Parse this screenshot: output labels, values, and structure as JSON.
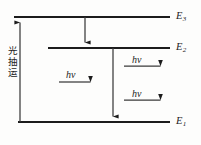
{
  "figure": {
    "type": "energy-level-diagram",
    "background_color": "#fdfdfc",
    "ink_color": "#1c1c1c",
    "width": 201,
    "height": 145
  },
  "levels": [
    {
      "id": "E3",
      "label": "E",
      "subscript": "3",
      "y": 17,
      "x_start": 14,
      "x_end": 170,
      "label_x": 176,
      "label_y": 11
    },
    {
      "id": "E2",
      "label": "E",
      "subscript": "2",
      "y": 48,
      "x_start": 48,
      "x_end": 170,
      "label_x": 176,
      "label_y": 42
    },
    {
      "id": "E1",
      "label": "E",
      "subscript": "1",
      "y": 122,
      "x_start": 18,
      "x_end": 170,
      "label_x": 176,
      "label_y": 116
    }
  ],
  "pump": {
    "label": "光抽运",
    "label_x": 7,
    "label_y": 45,
    "arrow_x": 20,
    "from_y": 122,
    "to_y": 17,
    "direction": "up"
  },
  "transitions": [
    {
      "id": "nonradiative-3-to-2",
      "x": 85,
      "from_y": 17,
      "to_y": 48,
      "direction": "down"
    },
    {
      "id": "lasing-2-to-1",
      "x": 113,
      "from_y": 48,
      "to_y": 122,
      "direction": "down"
    }
  ],
  "photons": [
    {
      "id": "photon-left",
      "label": "hν",
      "label_x": 66,
      "label_y": 70,
      "arrow_x_start": 59,
      "arrow_x_end": 96,
      "arrow_y": 82
    },
    {
      "id": "photon-right-upper",
      "label": "hν",
      "label_x": 132,
      "label_y": 55,
      "arrow_x_start": 124,
      "arrow_x_end": 166,
      "arrow_y": 66
    },
    {
      "id": "photon-right-lower",
      "label": "hν",
      "label_x": 132,
      "label_y": 89,
      "arrow_x_start": 124,
      "arrow_x_end": 166,
      "arrow_y": 100
    }
  ]
}
